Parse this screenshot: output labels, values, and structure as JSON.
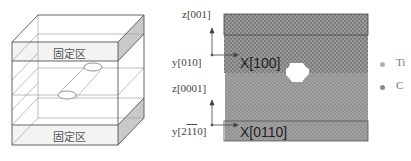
{
  "left_schematic": {
    "top_fixed_label": "固定区",
    "bottom_fixed_label": "固定区",
    "colors": {
      "edge": "#555555",
      "thin_line": "#9a9a9a",
      "side_shade": "#c8c8c8",
      "band_fill": "#f2f2f2"
    }
  },
  "right_atomic_panel": {
    "upper_crystal": {
      "axis_vertical_label": "z[001]",
      "axis_horizontal_label": "y[010]",
      "direction_label": "X[100]"
    },
    "lower_crystal": {
      "axis_vertical_label": "z[0001]",
      "axis_horizontal_label_prefix": "y[2",
      "axis_horizontal_label_bar1": "1",
      "axis_horizontal_label_bar2": "1",
      "axis_horizontal_label_suffix": "0]",
      "direction_label": "X[0110]"
    },
    "colors": {
      "atoms": "#8c8c8c",
      "atoms_light": "#a9a9a9",
      "hole": "#ffffff",
      "band_border": "#444444"
    }
  },
  "legend": {
    "items": [
      {
        "label": "Ti",
        "color": "#b0b0b0"
      },
      {
        "label": "C",
        "color": "#8a8a8a"
      }
    ]
  }
}
